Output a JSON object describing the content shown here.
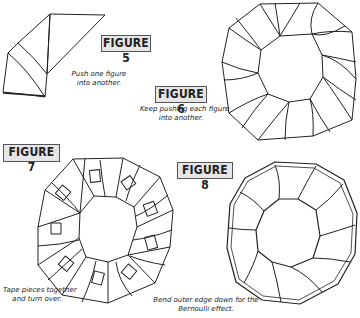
{
  "figures": [
    {
      "id": "figure-5",
      "label": "FIGURE 5",
      "caption_lines": [
        "Push one figure",
        "into another."
      ]
    },
    {
      "id": "figure-6",
      "label": "FIGURE 6",
      "caption_lines": [
        "Keep pushing each figure",
        "into another."
      ]
    },
    {
      "id": "figure-7",
      "label": "FIGURE 7",
      "caption_lines": [
        "Tape pieces together",
        "and turn over."
      ]
    },
    {
      "id": "figure-8",
      "label": "FIGURE 8",
      "caption_lines": [
        "Bend outer edge down for the",
        "Bernoulli effect."
      ]
    }
  ],
  "colors": {
    "line": "#222222",
    "label_bg": "#e6e6e6",
    "label_border": "#555555"
  }
}
